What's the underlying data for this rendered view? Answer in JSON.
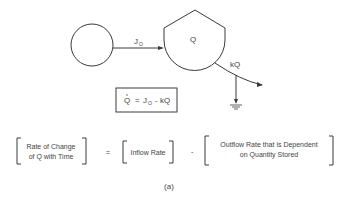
{
  "diagram": {
    "source_label": "",
    "flow_in_label": "J",
    "flow_in_sub": "O",
    "compartment_label": "Q",
    "flow_out_label": "kQ",
    "equation": {
      "q_dot": "Q",
      "equals": "=",
      "j": "J",
      "j_sub": "O",
      "minus_kq": "- kQ"
    },
    "word_equation": {
      "term1_line1": "Rate of Change",
      "term1_line2": "of Q with Time",
      "equals": "=",
      "term2": "Inflow Rate",
      "minus": "-",
      "term3_line1": "Outflow Rate that is Dependent",
      "term3_line2": "on Quantity Stored"
    },
    "caption": "(a)"
  },
  "colors": {
    "stroke": "#3a3a3a",
    "text": "#444444"
  }
}
